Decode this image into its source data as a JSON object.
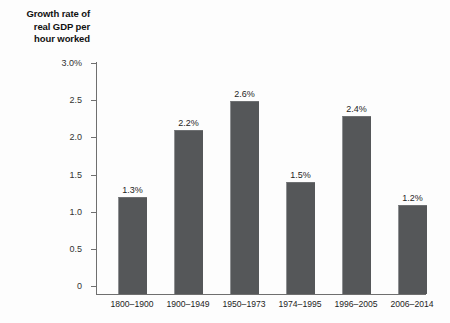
{
  "chart_data": {
    "type": "bar",
    "title": "",
    "ylabel": "Growth rate of real GDP per hour worked",
    "ylabel_lines": [
      "Growth rate of",
      "real GDP per",
      "hour worked"
    ],
    "xlabel": "",
    "categories": [
      "1800–1900",
      "1900–1949",
      "1950–1973",
      "1974–1995",
      "1996–2005",
      "2006–2014"
    ],
    "values": [
      1.3,
      2.2,
      2.6,
      1.5,
      2.4,
      1.2
    ],
    "value_labels": [
      "1.3%",
      "2.2%",
      "2.6%",
      "1.5%",
      "2.4%",
      "1.2%"
    ],
    "ylim": [
      0,
      3.0
    ],
    "yticks": [
      0,
      0.5,
      1.0,
      1.5,
      2.0,
      2.5,
      3.0
    ],
    "ytick_labels": [
      "0",
      "0.5",
      "1.0",
      "1.5",
      "2.0",
      "2.5",
      "3.0%"
    ],
    "grid": false,
    "legend": null,
    "bar_color": "#555759",
    "axis_color": "#6f6f6f",
    "text_color": "#1d1d1d"
  }
}
